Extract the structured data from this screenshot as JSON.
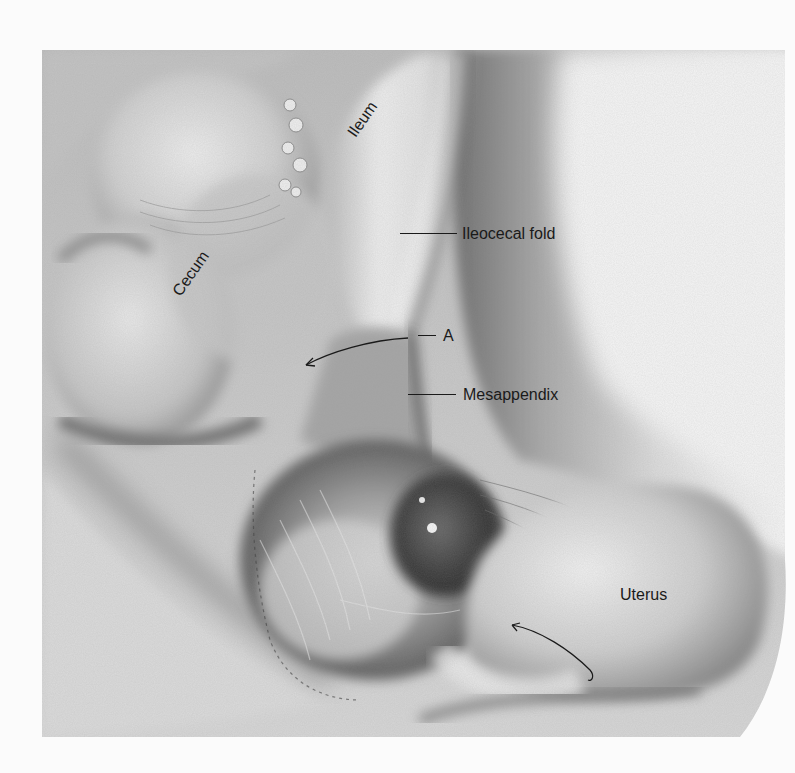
{
  "figure": {
    "type": "anatomical-illustration",
    "style": "grayscale pencil/airbrush surgical drawing",
    "labels": {
      "ileum": "Ileum",
      "cecum": "Cecum",
      "ileocecal_fold": "Ileocecal fold",
      "a": "A",
      "mesappendix": "Mesappendix",
      "uterus": "Uterus"
    },
    "colors": {
      "background": "#fbfbfb",
      "label_text": "#1a1a1a",
      "tissue_light": "#e2e2e2",
      "tissue_mid": "#a8a8a8",
      "tissue_dark": "#505050"
    }
  }
}
